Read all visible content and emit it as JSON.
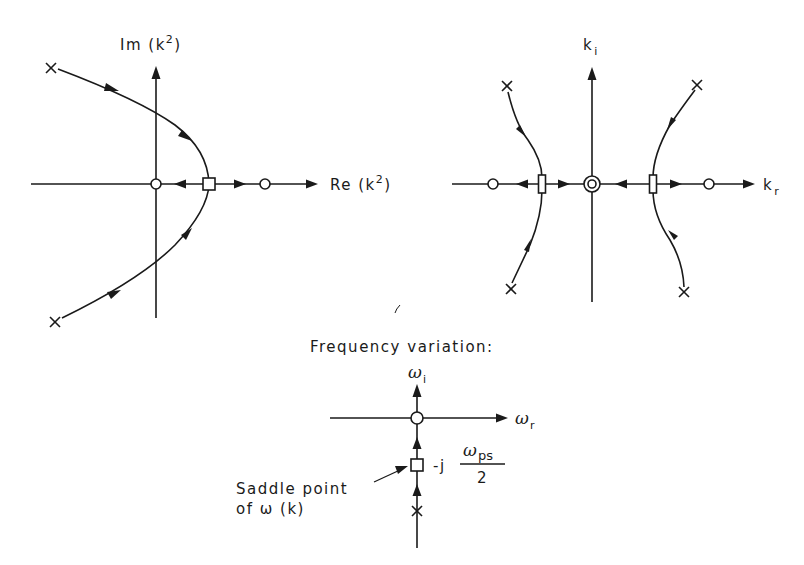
{
  "diagrams": {
    "left": {
      "title": "k-squared plane",
      "y_axis_label": "Im (k",
      "y_axis_sup": "2",
      "y_axis_close": ")",
      "x_axis_label": "Re (k",
      "x_axis_sup": "2",
      "x_axis_close": ")",
      "markers": {
        "poles_x": 2,
        "zeros_circle": 2,
        "saddle_square": 1
      }
    },
    "right": {
      "title": "k plane",
      "y_axis_label": "k",
      "y_axis_sub": "i",
      "x_axis_label": "k",
      "x_axis_sub": "r",
      "markers": {
        "poles_x": 4,
        "zeros_circle": 2,
        "double_zero_circle": 1,
        "saddle_rect": 2
      }
    },
    "bottom": {
      "heading": "Frequency variation:",
      "y_axis_label": "ω",
      "y_axis_sub": "i",
      "x_axis_label": "ω",
      "x_axis_sub": "r",
      "saddle_value_prefix": "-j",
      "saddle_value_numerator": "ω",
      "saddle_value_numerator_sub": "ps",
      "saddle_value_denominator": "2",
      "annotation_line1": "Saddle point",
      "annotation_line2": "of ω (k)"
    }
  },
  "colors": {
    "ink": "#1a1a1a",
    "background": "#ffffff"
  }
}
